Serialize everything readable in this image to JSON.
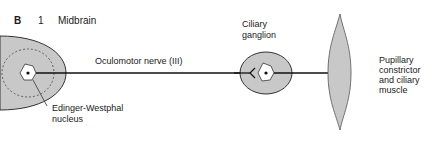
{
  "figure": {
    "panel_letter": "B",
    "panel_number": "1",
    "panel_title": "Midbrain"
  },
  "labels": {
    "nerve": "Oculomotor nerve (III)",
    "ganglion": [
      "Ciliary",
      "ganglion"
    ],
    "nucleus": [
      "Edinger-Westphal",
      "nucleus"
    ],
    "effector": [
      "Pupillary",
      "constrictor",
      "and ciliary",
      "muscle"
    ]
  },
  "colors": {
    "tissue_fill": "#c8c8c8",
    "outline": "#333333",
    "line": "#111111"
  }
}
